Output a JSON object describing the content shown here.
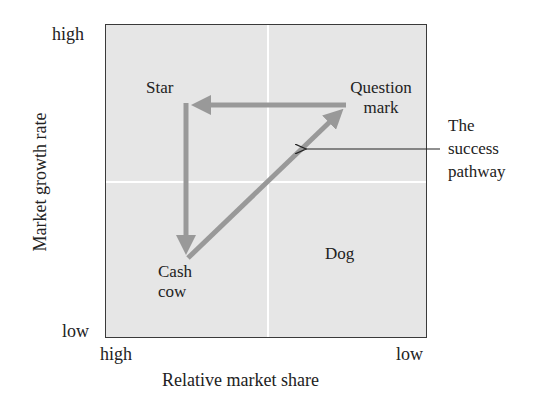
{
  "diagram": {
    "type": "BCG growth-share matrix",
    "axes": {
      "y": {
        "label": "Market growth rate",
        "high": "high",
        "low": "low"
      },
      "x": {
        "label": "Relative market share",
        "high": "high",
        "low": "low"
      }
    },
    "quadrants": {
      "star": "Star",
      "question_mark": [
        "Question",
        "mark"
      ],
      "cash_cow": [
        "Cash",
        "cow"
      ],
      "dog": "Dog"
    },
    "annotation": [
      "The",
      "success",
      "pathway"
    ],
    "arrows": [
      {
        "from": "question_mark",
        "to": "star"
      },
      {
        "from": "star",
        "to": "cash_cow"
      },
      {
        "from": "cash_cow",
        "to": "question_mark"
      }
    ],
    "colors": {
      "matrix_bg": "#e6e6e6",
      "gridline": "#ffffff",
      "pathway_arrow": "#999999",
      "border": "#3a3a3a",
      "text": "#222222"
    }
  }
}
